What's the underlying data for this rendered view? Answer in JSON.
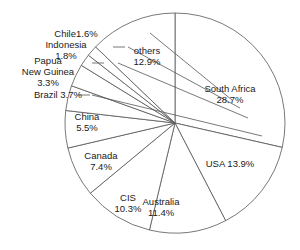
{
  "chart_data": {
    "type": "pie",
    "title": "",
    "subtitle": "",
    "xlabel": "",
    "ylabel": "",
    "legend_position": "none",
    "grid": false,
    "units": "percent",
    "start_angle_deg": 0,
    "direction": "clockwise",
    "categories": [
      "South Africa",
      "USA",
      "Australia",
      "CIS",
      "Canada",
      "China",
      "Brazil",
      "Papua New Guinea",
      "Indonesia",
      "Chile",
      "others"
    ],
    "values": [
      28.7,
      13.9,
      11.4,
      10.3,
      7.4,
      5.5,
      3.7,
      3.3,
      1.8,
      1.6,
      12.9
    ],
    "slices": [
      {
        "name": "South Africa",
        "value": 28.7,
        "label_name": "South Africa",
        "label_value": "28.7%",
        "label_text": "South Africa\n28.7%"
      },
      {
        "name": "USA",
        "value": 13.9,
        "label_name": "USA",
        "label_value": "13.9%",
        "label_text": "USA 13.9%"
      },
      {
        "name": "Australia",
        "value": 11.4,
        "label_name": "Australia",
        "label_value": "11.4%",
        "label_text": "Australia\n11.4%"
      },
      {
        "name": "CIS",
        "value": 10.3,
        "label_name": "CIS",
        "label_value": "10.3%",
        "label_text": "CIS\n10.3%"
      },
      {
        "name": "Canada",
        "value": 7.4,
        "label_name": "Canada",
        "label_value": "7.4%",
        "label_text": "Canada\n7.4%"
      },
      {
        "name": "China",
        "value": 5.5,
        "label_name": "China",
        "label_value": "5.5%",
        "label_text": "China\n5.5%"
      },
      {
        "name": "Brazil",
        "value": 3.7,
        "label_name": "Brazil",
        "label_value": "3.7%",
        "label_text": "Brazil 3.7%"
      },
      {
        "name": "Papua New Guinea",
        "value": 3.3,
        "label_name": "Papua New Guinea",
        "label_value": "3.3%",
        "label_text": "Papua\nNew Guinea\n3.3%"
      },
      {
        "name": "Indonesia",
        "value": 1.8,
        "label_name": "Indonesia",
        "label_value": "1.8%",
        "label_text": "Indonesia\n1.8%"
      },
      {
        "name": "Chile",
        "value": 1.6,
        "label_name": "Chile",
        "label_value": "1.6%",
        "label_text": "Chile1.6%"
      },
      {
        "name": "others",
        "value": 12.9,
        "label_name": "others",
        "label_value": "12.9%",
        "label_text": "others\n12.9%"
      }
    ]
  },
  "labels": {
    "south_africa": "South Africa\n28.7%",
    "usa": "USA 13.9%",
    "australia": "Australia\n11.4%",
    "cis": "CIS\n10.3%",
    "canada": "Canada\n7.4%",
    "china": "China\n5.5%",
    "brazil": "Brazil 3.7%",
    "papua_new_guinea": "Papua\nNew Guinea\n3.3%",
    "indonesia": "Indonesia\n1.8%",
    "chile": "Chile1.6%",
    "others": "others\n12.9%"
  },
  "colors": {
    "slice_fill": "#ffffff",
    "slice_stroke": "#555555",
    "text": "#1a1a1a",
    "background": "#ffffff"
  },
  "geometry": {
    "center_x": 175,
    "center_y": 123,
    "radius": 110
  }
}
